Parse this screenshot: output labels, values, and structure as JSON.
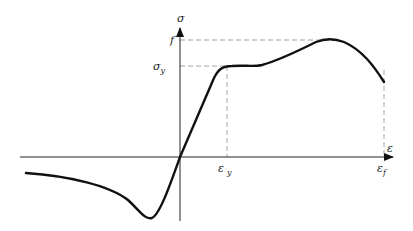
{
  "diagram": {
    "colors": {
      "curve": "#111111",
      "axis": "#222222",
      "dashed": "#999999"
    },
    "labels": {
      "y_axis": "σ",
      "x_axis": "ε",
      "f": "f",
      "sigma_y": "σ",
      "sigma_y_sub": "y",
      "eps_y": "ε",
      "eps_y_sub": "y",
      "eps_f": "ε",
      "eps_f_sub": "f"
    }
  }
}
